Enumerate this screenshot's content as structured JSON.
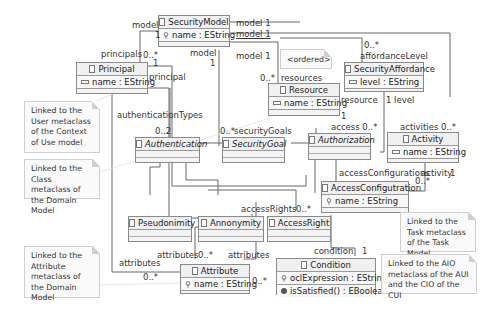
{
  "diagram": {
    "type": "UML class diagram",
    "classes": {
      "security_model": {
        "name": "SecurityModel",
        "attrs": [
          "name : EString"
        ]
      },
      "principal": {
        "name": "Principal",
        "attrs": [
          "name : EString"
        ]
      },
      "resource": {
        "name": "Resource",
        "attrs": [
          "name : EString"
        ]
      },
      "security_affordance": {
        "name": "SecurityAffordance",
        "attrs": [
          "level : EString"
        ]
      },
      "authentication": {
        "name": "Authentication",
        "abstract": true
      },
      "security_goal": {
        "name": "SecurityGoal",
        "abstract": true
      },
      "authorization": {
        "name": "Authorization",
        "abstract": true
      },
      "activity": {
        "name": "Activity",
        "attrs": [
          "name : EString"
        ]
      },
      "access_configuration": {
        "name": "AccessConfigutration",
        "attrs": [
          "name : EString"
        ]
      },
      "pseudonimity": {
        "name": "Pseudonimity"
      },
      "annonymity": {
        "name": "Annonymity"
      },
      "access_right": {
        "name": "AccessRight"
      },
      "attribute": {
        "name": "Attribute",
        "attrs": [
          "name : EString"
        ]
      },
      "condition": {
        "name": "Condition",
        "attrs": [
          "oclExpression : EString"
        ],
        "ops": [
          "isSatisfied() : EBoolean"
        ]
      }
    },
    "labels": {
      "model_left": "model",
      "one_a": "1",
      "model1_a": "model 1",
      "model1_b": "model 1",
      "model1_c": "model 1",
      "principals": "principals",
      "principals_mult": "0..*",
      "principal_one": "1",
      "principal_role": "principal",
      "model_mid": "model",
      "model_mid_mult": "1",
      "affordance_mult": "0..*",
      "affordance_level": "affordanceLevel",
      "ordered": "<ordered>",
      "resources_mult": "0..*",
      "resources": "resources",
      "resource_role": "resource",
      "resource_one": "1",
      "level_one": "1 level",
      "authentication_types": "authenticationTypes",
      "auth_mult": "0..2",
      "security_goals_mult": "0..*",
      "security_goals": "securityGoals",
      "access": "access 0..*",
      "activities": "activities 0..*",
      "access_configurations": "accessConfigurations",
      "access_configurations_mult": "0..*",
      "activity_role": "activity",
      "activity_one": "1",
      "access_rights": "accessRights",
      "access_rights_mult": "0..*",
      "attributes_left": "attributes",
      "attributes_left_mult": "0..*",
      "attributes_top": "attributes",
      "attributes_top_mult": "0..*",
      "attributes_right": "attributes",
      "attributes_right_mult": "0..*",
      "condition_role": "condition",
      "condition_one": "1"
    },
    "notes": {
      "user": "Linked to the User metaclass of the Context of Use model",
      "class": "Linked to the Class metaclass  of the Domain Model",
      "attribute": "Linked to the Attribute metaclass  of the Domain Model",
      "task": "Linked to the Task metaclass of the Task Model",
      "aio": "Linked to the AIO metaclass of the AUI and the CIO of the CUI"
    }
  }
}
